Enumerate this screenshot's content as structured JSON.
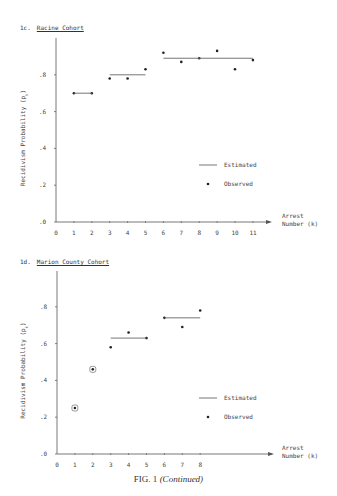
{
  "panels": [
    {
      "label": "1c.",
      "title": "Racine Cohort"
    },
    {
      "label": "1d.",
      "title": "Marion County Cohort"
    }
  ],
  "caption": {
    "prefix": "FIG. 1",
    "suffix": "(Continued)"
  },
  "chart_data": [
    {
      "type": "scatter",
      "title": "1c. Racine Cohort",
      "xlabel": "Arrest Number (k)",
      "ylabel": "Recidivism Probability (p_k)",
      "x_ticks": [
        0,
        1,
        2,
        3,
        4,
        5,
        6,
        7,
        8,
        9,
        10,
        11
      ],
      "y_ticks": [
        ".0",
        ".2",
        ".4",
        ".6",
        ".8"
      ],
      "ylim": [
        0,
        1.0
      ],
      "xlim": [
        0,
        12
      ],
      "grid": false,
      "legend": {
        "position": "right-middle",
        "entries": [
          "Estimated",
          "Observed"
        ]
      },
      "series": [
        {
          "name": "Observed",
          "style": "points",
          "x": [
            1,
            2,
            3,
            4,
            5,
            6,
            7,
            8,
            9,
            10,
            11
          ],
          "values": [
            0.7,
            0.7,
            0.78,
            0.78,
            0.83,
            0.92,
            0.87,
            0.89,
            0.93,
            0.83,
            0.88
          ]
        },
        {
          "name": "Estimated",
          "style": "step-segments",
          "segments": [
            {
              "x_start": 1,
              "x_end": 2,
              "value": 0.7
            },
            {
              "x_start": 3,
              "x_end": 5,
              "value": 0.8
            },
            {
              "x_start": 6,
              "x_end": 11,
              "value": 0.89
            }
          ]
        }
      ]
    },
    {
      "type": "scatter",
      "title": "1d. Marion County Cohort",
      "xlabel": "Arrest Number (k)",
      "ylabel": "Recidivism Probability (p_k)",
      "x_ticks": [
        0,
        1,
        2,
        3,
        4,
        5,
        6,
        7,
        8
      ],
      "y_ticks": [
        ".0",
        ".2",
        ".4",
        ".6",
        ".8"
      ],
      "ylim": [
        0,
        1.0
      ],
      "xlim": [
        0,
        12
      ],
      "grid": false,
      "legend": {
        "position": "right-middle",
        "entries": [
          "Estimated",
          "Observed"
        ]
      },
      "annotations": [
        "Points k=1 and k=2 are circled"
      ],
      "series": [
        {
          "name": "Observed",
          "style": "points",
          "x": [
            1,
            2,
            3,
            4,
            5,
            6,
            7,
            8
          ],
          "values": [
            0.25,
            0.46,
            0.58,
            0.66,
            0.63,
            0.74,
            0.69,
            0.78
          ],
          "circled": [
            true,
            true,
            false,
            false,
            false,
            false,
            false,
            false
          ]
        },
        {
          "name": "Estimated",
          "style": "step-segments",
          "segments": [
            {
              "x_start": 3,
              "x_end": 5,
              "value": 0.63
            },
            {
              "x_start": 6,
              "x_end": 8,
              "value": 0.74
            }
          ]
        }
      ]
    }
  ]
}
